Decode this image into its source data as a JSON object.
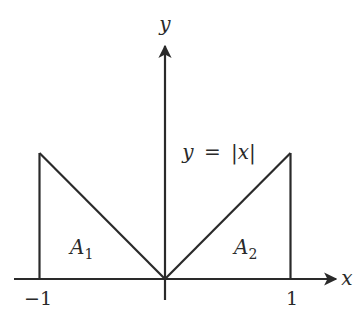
{
  "diagram": {
    "axes": {
      "x_label": "x",
      "y_label": "y",
      "x_tick_labels": [
        "−1",
        "1"
      ],
      "x_ticks": [
        -1,
        1
      ]
    },
    "curve": {
      "equation_lhs": "y",
      "equation_eq": "=",
      "equation_rhs": "|x|",
      "function": "abs",
      "domain": [
        -1,
        1
      ]
    },
    "regions": [
      {
        "name": "A",
        "subscript": "1",
        "interval": [
          -1,
          0
        ]
      },
      {
        "name": "A",
        "subscript": "2",
        "interval": [
          0,
          1
        ]
      }
    ],
    "colors": {
      "ink": "#2a2a2a",
      "background": "#ffffff"
    }
  }
}
